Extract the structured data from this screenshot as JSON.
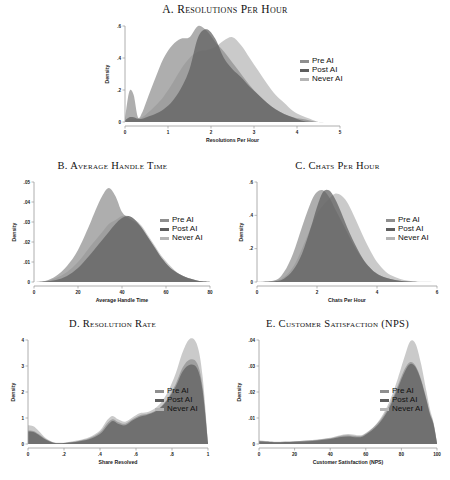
{
  "figure": {
    "background": "#ffffff",
    "legend_labels": [
      "Pre AI",
      "Post AI",
      "Never AI"
    ],
    "colors": {
      "pre_ai": "#8f8f8f",
      "post_ai": "#5e5e5e",
      "never_ai": "#b5b5b5",
      "axis": "#9a9a9a",
      "text": "#1a1a1a"
    }
  },
  "chart_data": [
    {
      "id": "A",
      "type": "area",
      "title": "A. Resolutions Per Hour",
      "xlabel": "Resolutions Per Hour",
      "ylabel": "Density",
      "xlim": [
        0,
        5
      ],
      "ylim": [
        0,
        0.6
      ],
      "xticks": [
        0,
        1,
        2,
        3,
        4,
        5
      ],
      "xticklabels": [
        "0",
        "1",
        "2",
        "3",
        "4",
        "5"
      ],
      "yticks": [
        0,
        0.2,
        0.4,
        0.6
      ],
      "yticklabels": [
        "0",
        ".2",
        ".4",
        ".6"
      ],
      "grid": false,
      "legend_position": "right",
      "legend_entries": [
        "Pre AI",
        "Post AI",
        "Never AI"
      ],
      "x": [
        0,
        0.1,
        0.2,
        0.3,
        0.4,
        0.5,
        0.7,
        0.9,
        1.1,
        1.3,
        1.5,
        1.7,
        1.9,
        2.1,
        2.3,
        2.5,
        2.7,
        2.9,
        3.1,
        3.3,
        3.5,
        3.7,
        3.9,
        4.1,
        4.3,
        4.5,
        4.7,
        5.0
      ],
      "series": [
        {
          "name": "Pre AI",
          "values": [
            0.02,
            0.19,
            0.17,
            0.03,
            0.06,
            0.13,
            0.27,
            0.4,
            0.48,
            0.52,
            0.53,
            0.6,
            0.57,
            0.5,
            0.44,
            0.37,
            0.3,
            0.23,
            0.17,
            0.12,
            0.08,
            0.05,
            0.03,
            0.02,
            0.01,
            0.0,
            0.0,
            0.0
          ]
        },
        {
          "name": "Post AI",
          "values": [
            0.01,
            0.03,
            0.03,
            0.02,
            0.02,
            0.03,
            0.05,
            0.08,
            0.13,
            0.21,
            0.33,
            0.53,
            0.58,
            0.52,
            0.4,
            0.33,
            0.28,
            0.22,
            0.17,
            0.12,
            0.08,
            0.05,
            0.03,
            0.01,
            0.0,
            0.0,
            0.0,
            0.0
          ]
        },
        {
          "name": "Never AI",
          "values": [
            0.01,
            0.02,
            0.02,
            0.02,
            0.03,
            0.05,
            0.1,
            0.16,
            0.24,
            0.33,
            0.4,
            0.44,
            0.45,
            0.47,
            0.51,
            0.53,
            0.48,
            0.4,
            0.32,
            0.24,
            0.17,
            0.12,
            0.07,
            0.04,
            0.02,
            0.0,
            0.0,
            0.0
          ]
        }
      ]
    },
    {
      "id": "B",
      "type": "area",
      "title": "B. Average Handle Time",
      "xlabel": "Average Handle Time",
      "ylabel": "Density",
      "xlim": [
        0,
        80
      ],
      "ylim": [
        0,
        0.05
      ],
      "xticks": [
        0,
        20,
        40,
        60,
        80
      ],
      "xticklabels": [
        "0",
        "20",
        "40",
        "60",
        "80"
      ],
      "yticks": [
        0,
        0.01,
        0.02,
        0.03,
        0.04,
        0.05
      ],
      "yticklabels": [
        "0",
        ".01",
        ".02",
        ".03",
        ".04",
        ".05"
      ],
      "grid": false,
      "legend_position": "right",
      "legend_entries": [
        "Pre AI",
        "Post AI",
        "Never AI"
      ],
      "x": [
        0,
        5,
        10,
        15,
        20,
        25,
        28,
        31,
        34,
        37,
        40,
        43,
        46,
        49,
        52,
        55,
        58,
        62,
        66,
        70,
        74,
        78,
        80
      ],
      "series": [
        {
          "name": "Pre AI",
          "values": [
            0.0,
            0.0005,
            0.003,
            0.008,
            0.016,
            0.028,
            0.036,
            0.043,
            0.047,
            0.043,
            0.035,
            0.032,
            0.03,
            0.027,
            0.022,
            0.017,
            0.012,
            0.007,
            0.004,
            0.002,
            0.0008,
            0.0002,
            0.0
          ]
        },
        {
          "name": "Post AI",
          "values": [
            0.0,
            0.0003,
            0.001,
            0.003,
            0.007,
            0.013,
            0.017,
            0.021,
            0.025,
            0.029,
            0.032,
            0.033,
            0.031,
            0.027,
            0.022,
            0.017,
            0.012,
            0.007,
            0.004,
            0.002,
            0.0008,
            0.0002,
            0.0
          ]
        },
        {
          "name": "Never AI",
          "values": [
            0.0,
            0.0004,
            0.002,
            0.005,
            0.01,
            0.017,
            0.021,
            0.025,
            0.029,
            0.031,
            0.033,
            0.033,
            0.031,
            0.028,
            0.023,
            0.018,
            0.013,
            0.008,
            0.004,
            0.002,
            0.0008,
            0.0002,
            0.0
          ]
        }
      ]
    },
    {
      "id": "C",
      "type": "area",
      "title": "C. Chats Per Hour",
      "xlabel": "Chats Per Hour",
      "ylabel": "Density",
      "xlim": [
        0,
        6
      ],
      "ylim": [
        0,
        0.6
      ],
      "xticks": [
        0,
        2,
        4,
        6
      ],
      "xticklabels": [
        "0",
        "2",
        "4",
        "6"
      ],
      "yticks": [
        0,
        0.2,
        0.4,
        0.6
      ],
      "yticklabels": [
        "0",
        ".2",
        ".4",
        ".6"
      ],
      "grid": false,
      "legend_position": "right",
      "legend_entries": [
        "Pre AI",
        "Post AI",
        "Never AI"
      ],
      "x": [
        0,
        0.6,
        0.9,
        1.2,
        1.5,
        1.8,
        2.0,
        2.2,
        2.4,
        2.6,
        2.8,
        3.0,
        3.2,
        3.4,
        3.6,
        3.8,
        4.0,
        4.3,
        4.6,
        4.9,
        5.2,
        5.5,
        6.0
      ],
      "series": [
        {
          "name": "Pre AI",
          "values": [
            0.0,
            0.01,
            0.06,
            0.17,
            0.33,
            0.48,
            0.54,
            0.55,
            0.51,
            0.44,
            0.37,
            0.3,
            0.23,
            0.17,
            0.12,
            0.08,
            0.05,
            0.025,
            0.012,
            0.005,
            0.002,
            0.0005,
            0.0
          ]
        },
        {
          "name": "Post AI",
          "values": [
            0.0,
            0.005,
            0.02,
            0.07,
            0.17,
            0.33,
            0.45,
            0.54,
            0.55,
            0.5,
            0.42,
            0.33,
            0.25,
            0.18,
            0.12,
            0.08,
            0.05,
            0.025,
            0.012,
            0.005,
            0.002,
            0.0005,
            0.0
          ]
        },
        {
          "name": "Never AI",
          "values": [
            0.0,
            0.008,
            0.03,
            0.09,
            0.2,
            0.33,
            0.41,
            0.46,
            0.5,
            0.53,
            0.52,
            0.48,
            0.41,
            0.33,
            0.25,
            0.18,
            0.12,
            0.06,
            0.03,
            0.012,
            0.004,
            0.001,
            0.0
          ]
        }
      ]
    },
    {
      "id": "D",
      "type": "area",
      "title": "D. Resolution Rate",
      "xlabel": "Share Resolved",
      "ylabel": "Density",
      "xlim": [
        0,
        1
      ],
      "ylim": [
        0,
        4
      ],
      "xticks": [
        0,
        0.2,
        0.4,
        0.6,
        0.8,
        1.0
      ],
      "xticklabels": [
        "0",
        ".2",
        ".4",
        ".6",
        ".8",
        "1"
      ],
      "yticks": [
        0,
        1,
        2,
        3,
        4
      ],
      "yticklabels": [
        "0",
        "1",
        "2",
        "3",
        "4"
      ],
      "grid": false,
      "legend_position": "right",
      "legend_entries": [
        "Pre AI",
        "Post AI",
        "Never AI"
      ],
      "x": [
        0.0,
        0.03,
        0.06,
        0.1,
        0.14,
        0.18,
        0.22,
        0.28,
        0.34,
        0.4,
        0.44,
        0.47,
        0.5,
        0.54,
        0.58,
        0.62,
        0.66,
        0.7,
        0.74,
        0.78,
        0.82,
        0.86,
        0.9,
        0.94,
        0.97,
        1.0
      ],
      "series": [
        {
          "name": "Pre AI",
          "values": [
            0.52,
            0.5,
            0.38,
            0.18,
            0.06,
            0.04,
            0.06,
            0.12,
            0.22,
            0.45,
            0.8,
            0.95,
            0.85,
            0.78,
            0.95,
            1.1,
            1.15,
            1.25,
            1.45,
            1.8,
            2.3,
            2.95,
            3.25,
            3.1,
            2.2,
            0.05
          ]
        },
        {
          "name": "Post AI",
          "values": [
            0.48,
            0.46,
            0.35,
            0.16,
            0.05,
            0.03,
            0.05,
            0.1,
            0.18,
            0.38,
            0.7,
            0.88,
            0.78,
            0.72,
            0.9,
            1.05,
            1.12,
            1.22,
            1.42,
            1.75,
            2.2,
            2.8,
            3.05,
            2.9,
            2.05,
            0.04
          ]
        },
        {
          "name": "Never AI",
          "values": [
            0.72,
            0.68,
            0.5,
            0.22,
            0.07,
            0.05,
            0.07,
            0.14,
            0.26,
            0.52,
            0.92,
            1.08,
            0.95,
            0.86,
            1.02,
            1.18,
            1.22,
            1.35,
            1.6,
            2.05,
            2.7,
            3.55,
            4.05,
            3.8,
            2.6,
            0.06
          ]
        }
      ]
    },
    {
      "id": "E",
      "type": "area",
      "title": "E. Customer Satisfaction (NPS)",
      "xlabel": "Customer Satisfaction (NPS)",
      "ylabel": "Density",
      "xlim": [
        0,
        100
      ],
      "ylim": [
        0,
        0.04
      ],
      "xticks": [
        0,
        20,
        40,
        60,
        80,
        100
      ],
      "xticklabels": [
        "0",
        "20",
        "40",
        "60",
        "80",
        "100"
      ],
      "yticks": [
        0,
        0.01,
        0.02,
        0.03,
        0.04
      ],
      "yticklabels": [
        "0",
        ".01",
        ".02",
        ".03",
        ".04"
      ],
      "grid": false,
      "legend_position": "right",
      "legend_entries": [
        "Pre AI",
        "Post AI",
        "Never AI"
      ],
      "x": [
        0,
        5,
        10,
        20,
        30,
        40,
        45,
        50,
        55,
        58,
        62,
        66,
        70,
        74,
        78,
        82,
        85,
        88,
        91,
        94,
        96,
        98,
        100
      ],
      "series": [
        {
          "name": "Pre AI",
          "values": [
            0.0012,
            0.001,
            0.0008,
            0.001,
            0.0014,
            0.0022,
            0.003,
            0.0034,
            0.003,
            0.0032,
            0.005,
            0.0075,
            0.011,
            0.016,
            0.0225,
            0.029,
            0.0315,
            0.03,
            0.025,
            0.0175,
            0.012,
            0.008,
            0.0005
          ]
        },
        {
          "name": "Post AI",
          "values": [
            0.001,
            0.0009,
            0.0007,
            0.0009,
            0.0012,
            0.0019,
            0.0026,
            0.0029,
            0.0026,
            0.0028,
            0.0045,
            0.0068,
            0.0102,
            0.015,
            0.0215,
            0.028,
            0.0308,
            0.0295,
            0.0245,
            0.017,
            0.0115,
            0.0076,
            0.0004
          ]
        },
        {
          "name": "Never AI",
          "values": [
            0.0013,
            0.0011,
            0.0009,
            0.0011,
            0.0015,
            0.0024,
            0.0033,
            0.0038,
            0.0034,
            0.0035,
            0.0052,
            0.0078,
            0.0118,
            0.0175,
            0.0252,
            0.034,
            0.0395,
            0.0385,
            0.031,
            0.0205,
            0.0135,
            0.0085,
            0.0006
          ]
        }
      ]
    }
  ]
}
